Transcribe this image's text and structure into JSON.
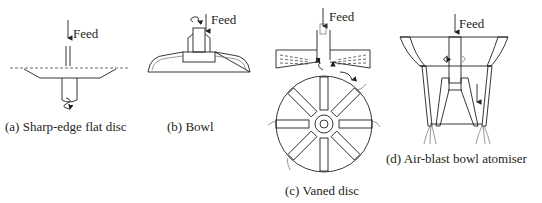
{
  "figure": {
    "panels": [
      {
        "id": "a",
        "feed_label": "Feed",
        "caption": "(a) Sharp-edge flat disc"
      },
      {
        "id": "b",
        "feed_label": "Feed",
        "caption": "(b) Bowl"
      },
      {
        "id": "c",
        "feed_label": "Feed",
        "caption": "(c) Vaned disc"
      },
      {
        "id": "d",
        "feed_label": "Feed",
        "caption": "(d) Air-blast bowl atomiser"
      }
    ]
  }
}
